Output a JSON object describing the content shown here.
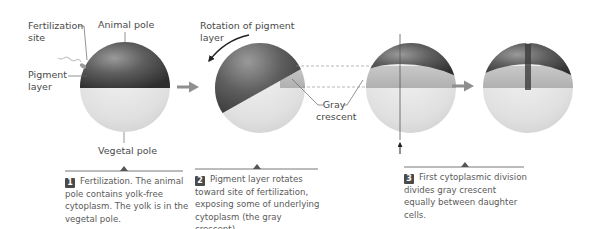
{
  "labels": {
    "fertilization_site": "Fertilization site",
    "fertilization_site_line1": "Fertilization",
    "fertilization_site_line2": "site",
    "animal_pole": "Animal pole",
    "pigment_layer_line1": "Pigment",
    "pigment_layer_line2": "layer",
    "vegetal_pole": "Vegetal pole",
    "rotation_line1": "Rotation of pigment",
    "rotation_line2": "layer",
    "gray_crescent_line1": "Gray",
    "gray_crescent_line2": "crescent"
  },
  "steps": [
    {
      "number": "1",
      "text": "Fertilization. The animal pole contains yolk-free cytoplasm. The yolk is in the vegetal pole."
    },
    {
      "number": "2",
      "text": "Pigment layer rotates toward site of fertilization, exposing some of underlying cytoplasm (the gray crescent)."
    },
    {
      "number": "3",
      "text": "First cytoplasmic division divides gray crescent equally between daughter cells."
    }
  ],
  "colors": {
    "pigment": "#4a4a4a",
    "yolk": "#e4e4e4",
    "gray_crescent": "#b8b8b8",
    "arrow": "#8a8a8a",
    "text": "#555555"
  }
}
